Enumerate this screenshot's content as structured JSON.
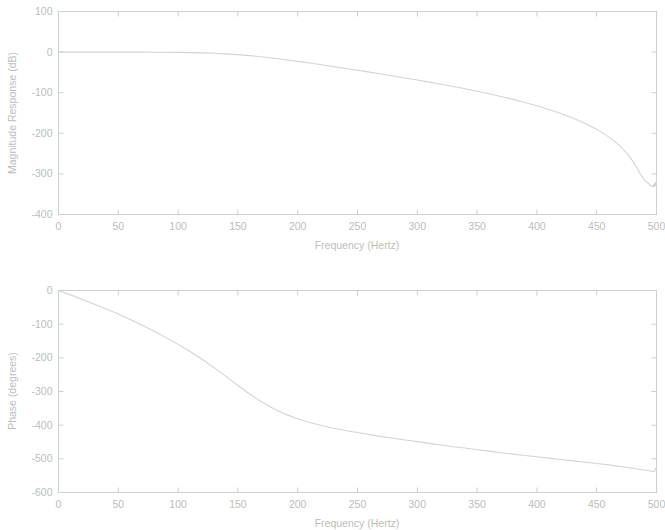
{
  "figure": {
    "title": "",
    "background": "#ffffff",
    "curve_color": "#d4d4d4",
    "axis_color": "#cfcfcf",
    "label_color": "#bdbdbd"
  },
  "chart_data": [
    {
      "type": "line",
      "id": "magnitude-response",
      "title": "",
      "xlabel": "Frequency (Hertz)",
      "ylabel": "Magnitude Response (dB)",
      "xlim": [
        0,
        500
      ],
      "ylim": [
        -400,
        100
      ],
      "xticks": [
        0,
        50,
        100,
        150,
        200,
        250,
        300,
        350,
        400,
        450,
        500
      ],
      "xticklabels": [
        "0",
        "50",
        "100",
        "150",
        "200",
        "250",
        "300",
        "350",
        "400",
        "450",
        "500"
      ],
      "yticks": [
        100,
        0,
        -100,
        -200,
        -300,
        -400
      ],
      "yticklabels": [
        "100",
        "0",
        "-100",
        "-200",
        "-300",
        "-400"
      ],
      "grid": false,
      "legend": null,
      "series": [
        {
          "name": "Magnitude Response",
          "x": [
            0,
            10,
            20,
            30,
            40,
            50,
            60,
            70,
            80,
            90,
            100,
            110,
            120,
            130,
            140,
            150,
            160,
            170,
            180,
            190,
            200,
            210,
            220,
            230,
            240,
            250,
            260,
            270,
            280,
            290,
            300,
            310,
            320,
            330,
            340,
            350,
            360,
            370,
            380,
            390,
            400,
            410,
            420,
            430,
            440,
            450,
            460,
            465,
            470,
            475,
            480,
            483,
            486,
            489,
            491,
            493,
            494,
            495,
            496,
            497,
            497.5,
            498,
            498.5,
            499,
            499.3,
            499.6,
            500
          ],
          "y": [
            0,
            0,
            0,
            0,
            0,
            0,
            0,
            0,
            -0.2,
            -0.4,
            -0.7,
            -1.2,
            -1.9,
            -2.9,
            -4.3,
            -6.2,
            -8.6,
            -11.6,
            -15.0,
            -18.8,
            -22.8,
            -27.0,
            -31.3,
            -35.7,
            -40.2,
            -44.7,
            -49.3,
            -54.0,
            -58.8,
            -63.7,
            -68.7,
            -73.9,
            -79.2,
            -84.7,
            -90.4,
            -96.4,
            -102.7,
            -109.4,
            -116.5,
            -124.1,
            -132.3,
            -141.3,
            -151.2,
            -162.4,
            -175.2,
            -190.3,
            -208.8,
            -219.9,
            -232.8,
            -248.4,
            -268.0,
            -281.8,
            -297.5,
            -312.0,
            -318.0,
            -322.5,
            -325.5,
            -328.0,
            -330.5,
            -332.0,
            -326.0,
            -331.0,
            -324.0,
            -330.0,
            -320.0,
            -327.0,
            -318.0
          ]
        }
      ]
    },
    {
      "type": "line",
      "id": "phase-response",
      "title": "",
      "xlabel": "Frequency (Hertz)",
      "ylabel": "Phase (degrees)",
      "xlim": [
        0,
        500
      ],
      "ylim": [
        -600,
        0
      ],
      "xticks": [
        0,
        50,
        100,
        150,
        200,
        250,
        300,
        350,
        400,
        450,
        500
      ],
      "xticklabels": [
        "0",
        "50",
        "100",
        "150",
        "200",
        "250",
        "300",
        "350",
        "400",
        "450",
        "500"
      ],
      "yticks": [
        0,
        -100,
        -200,
        -300,
        -400,
        -500,
        -600
      ],
      "yticklabels": [
        "0",
        "-100",
        "-200",
        "-300",
        "-400",
        "-500",
        "-600"
      ],
      "grid": false,
      "legend": null,
      "series": [
        {
          "name": "Phase",
          "x": [
            0,
            10,
            20,
            30,
            40,
            50,
            60,
            70,
            80,
            90,
            100,
            110,
            120,
            130,
            140,
            150,
            160,
            170,
            180,
            190,
            200,
            210,
            220,
            230,
            240,
            250,
            260,
            270,
            280,
            290,
            300,
            310,
            320,
            330,
            340,
            350,
            360,
            370,
            380,
            390,
            400,
            410,
            420,
            430,
            440,
            450,
            460,
            470,
            480,
            490,
            495,
            498,
            500
          ],
          "y": [
            0,
            -13,
            -27,
            -41,
            -55,
            -70,
            -86,
            -103,
            -121,
            -140,
            -160,
            -181,
            -204,
            -229,
            -255,
            -282,
            -308,
            -331,
            -351,
            -368,
            -381,
            -392,
            -401,
            -409,
            -416,
            -422,
            -428,
            -434,
            -439,
            -444,
            -449,
            -454,
            -459,
            -464,
            -468,
            -473,
            -477,
            -482,
            -486,
            -490,
            -494,
            -498,
            -502,
            -506,
            -510,
            -514,
            -518,
            -523,
            -528,
            -533,
            -536,
            -538,
            -524
          ]
        }
      ]
    }
  ]
}
